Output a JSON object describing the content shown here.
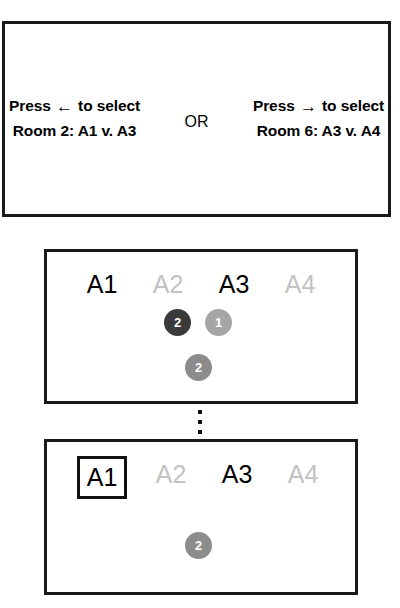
{
  "prompt_panel": {
    "left_option": {
      "line1_prefix": "Press ",
      "arrow": "←",
      "line1_suffix": " to select",
      "line2": "Room 2: A1 v. A3"
    },
    "separator": "OR",
    "right_option": {
      "line1_prefix": "Press ",
      "arrow": "→",
      "line1_suffix": " to select",
      "line2": "Room 6: A3 v. A4"
    }
  },
  "stage_current": {
    "agents": [
      {
        "label": "A1",
        "state": "active"
      },
      {
        "label": "A2",
        "state": "inactive"
      },
      {
        "label": "A3",
        "state": "active"
      },
      {
        "label": "A4",
        "state": "inactive"
      }
    ],
    "tokens": [
      {
        "value": "2",
        "color": "#3a3a3a",
        "x": 117,
        "y": 57
      },
      {
        "value": "1",
        "color": "#a6a6a6",
        "x": 158,
        "y": 57
      },
      {
        "value": "2",
        "color": "#8c8c8c",
        "x": 138,
        "y": 102
      }
    ]
  },
  "stage_final": {
    "agents": [
      {
        "label": "A1",
        "state": "active",
        "selected": true
      },
      {
        "label": "A2",
        "state": "inactive",
        "selected": false
      },
      {
        "label": "A3",
        "state": "active",
        "selected": false
      },
      {
        "label": "A4",
        "state": "inactive",
        "selected": false
      }
    ],
    "tokens": [
      {
        "value": "2",
        "color": "#8c8c8c",
        "x": 138,
        "y": 90
      }
    ]
  },
  "ellipsis": {
    "dots": [
      ".",
      ".",
      "."
    ]
  },
  "colors": {
    "panel_border": "#1a1a1a",
    "active_text": "#000000",
    "inactive_text": "#c2c2c2",
    "token_dark": "#3a3a3a",
    "token_mid": "#8c8c8c",
    "token_light": "#a6a6a6"
  }
}
